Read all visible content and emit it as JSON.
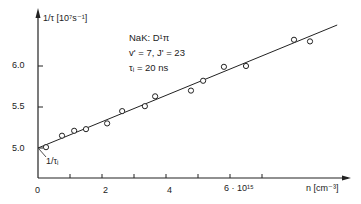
{
  "chart_data": {
    "type": "scatter",
    "title": "",
    "xlabel": "n [cm-3]",
    "ylabel": "1/τ [10^7 s^-1]",
    "x_unit_multiplier": "10^15",
    "xlim": [
      0,
      9
    ],
    "ylim": [
      4.6,
      6.6
    ],
    "x_ticks": [
      0,
      1,
      2,
      3,
      4,
      5,
      6,
      7
    ],
    "x_tick_labels": [
      "0",
      "",
      "2",
      "",
      "4",
      "",
      "6 · 10^15",
      ""
    ],
    "y_ticks": [
      5.0,
      5.5,
      6.0
    ],
    "y_tick_labels": [
      "5.0",
      "5.5",
      "6.0"
    ],
    "grid": false,
    "annotations": [
      "NaK: D¹π",
      "v' = 7,  J' = 23",
      "τi = 20 ns",
      "1/τi"
    ],
    "series": [
      {
        "name": "measurements",
        "marker": "open-circle",
        "x": [
          0.25,
          0.75,
          1.13,
          1.5,
          2.16,
          2.63,
          3.34,
          3.66,
          4.78,
          5.16,
          5.81,
          6.5,
          8.0,
          8.5
        ],
        "y": [
          5.01,
          5.15,
          5.21,
          5.23,
          5.3,
          5.45,
          5.51,
          5.63,
          5.7,
          5.82,
          5.99,
          6.0,
          6.32,
          6.3
        ]
      },
      {
        "name": "linear fit",
        "marker": "line",
        "x": [
          0,
          9.35
        ],
        "y": [
          5.0,
          6.5
        ]
      }
    ]
  },
  "labels": {
    "y_axis": "1/τ [10⁷s⁻¹]",
    "x_axis": "n [cm⁻³]",
    "x_tick_0": "0",
    "x_tick_2": "2",
    "x_tick_4": "4",
    "x_tick_6": "6 · 10¹⁵",
    "y_tick_50": "5.0",
    "y_tick_55": "5.5",
    "y_tick_60": "6.0",
    "ann_molecule": "NaK: D¹π",
    "ann_levels": "v' = 7,   J' = 23",
    "ann_tau": "τᵢ = 20 ns",
    "intercept": "1/τᵢ"
  }
}
